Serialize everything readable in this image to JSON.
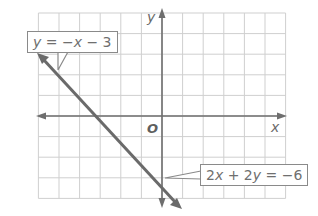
{
  "chart_data": {
    "type": "line",
    "title": "",
    "xlabel": "x",
    "ylabel": "y",
    "origin_label": "O",
    "xlim": [
      -6,
      6
    ],
    "ylim": [
      -4,
      5
    ],
    "grid": true,
    "tick_labels": false,
    "series": [
      {
        "name": "y = -x - 3",
        "equivalent": "2x + 2y = -6",
        "slope": -1,
        "y_intercept": -3,
        "x_intercept": -3,
        "points": [
          [
            -6,
            3
          ],
          [
            -3,
            0
          ],
          [
            0,
            -3
          ],
          [
            1,
            -4
          ]
        ]
      }
    ],
    "annotations": [
      {
        "text": "y = -x - 3",
        "points_to": [
          -5,
          2
        ]
      },
      {
        "text": "2x + 2y = -6",
        "points_to": [
          0,
          -3
        ]
      }
    ]
  },
  "labels": {
    "callout_top": {
      "parts": [
        "y",
        " = −",
        "x",
        " − 3"
      ]
    },
    "callout_bottom": {
      "parts": [
        "2",
        "x",
        " + 2",
        "y",
        " = −6"
      ]
    },
    "x_axis": "x",
    "y_axis": "y",
    "origin": "O"
  },
  "colors": {
    "grid": "#cfcfcf",
    "axis": "#6e6e6e",
    "line": "#6a6a6a",
    "text": "#6f6f6f"
  }
}
